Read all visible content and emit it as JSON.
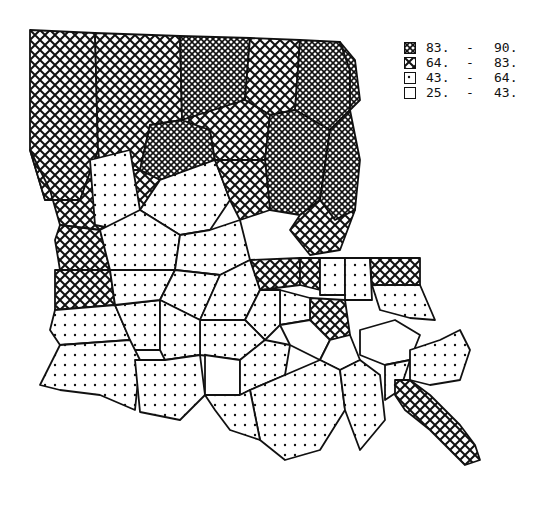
{
  "map": {
    "subject": "Louisiana parishes choropleth",
    "classes": [
      {
        "pattern": "dense-crosshatch",
        "low": "83.",
        "high": "90.",
        "dash": "-"
      },
      {
        "pattern": "crosshatch",
        "low": "64.",
        "high": "83.",
        "dash": "-"
      },
      {
        "pattern": "dots",
        "low": "43.",
        "high": "64.",
        "dash": "-"
      },
      {
        "pattern": "blank",
        "low": "25.",
        "high": "43.",
        "dash": "-"
      }
    ]
  },
  "colors": {
    "ink": "#111111",
    "paper": "#ffffff"
  }
}
